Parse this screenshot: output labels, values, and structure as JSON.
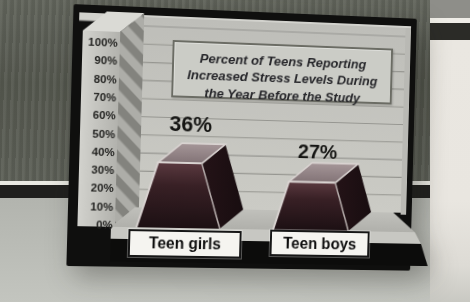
{
  "chart_data": {
    "type": "bar",
    "render_style": "3d-frustum-bars",
    "title": "Percent of Teens Reporting Increased Stress Levels During the Year Before the Study",
    "title_lines": [
      "Percent of Teens Reporting",
      "Increased Stress Levels During",
      "the Year Before the Study"
    ],
    "categories": [
      "Teen girls",
      "Teen boys"
    ],
    "values": [
      36,
      27
    ],
    "value_labels": [
      "36%",
      "27%"
    ],
    "xlabel": "",
    "ylabel": "",
    "ylim": [
      0,
      100
    ],
    "ytick_step": 10,
    "yticks": [
      "100%",
      "90%",
      "80%",
      "70%",
      "60%",
      "50%",
      "40%",
      "30%",
      "20%",
      "10%",
      "0%"
    ],
    "grid": "horizontal",
    "legend": "none",
    "colors": {
      "bar_front_light": "#5a393f",
      "bar_front_dark": "#1c1013",
      "bar_side": "#180d10",
      "bar_top_light": "#a59698",
      "bar_top_dark": "#827376",
      "bar_bevel": "#d9d3d1",
      "wall": "#c3c3be",
      "gridline": "#969691",
      "frame_mat": "#0f0f0e",
      "axis_column": "#c6c6c1",
      "stripe_dark": "#83837e",
      "stripe_light": "#adada8",
      "floor": "#b8b8b3",
      "title_box_bg": "#cbccc6",
      "title_box_border": "#6b6c64",
      "category_box_bg": "#f5f4f0",
      "text": "#1d1d1b"
    }
  }
}
